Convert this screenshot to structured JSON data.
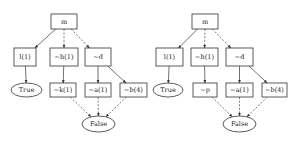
{
  "diagrams": [
    {
      "id": "left",
      "nodes": [
        {
          "key": "m",
          "label": "m",
          "shape": "box",
          "x": 51,
          "y": 14,
          "w": 26,
          "h": 15
        },
        {
          "key": "l1",
          "label": "l(1)",
          "shape": "box",
          "x": 14,
          "y": 48,
          "w": 22,
          "h": 18
        },
        {
          "key": "h1",
          "label": "~h(1)",
          "shape": "box",
          "x": 50,
          "y": 48,
          "w": 28,
          "h": 18
        },
        {
          "key": "d",
          "label": "~d",
          "shape": "box",
          "x": 85,
          "y": 48,
          "w": 26,
          "h": 18
        },
        {
          "key": "true",
          "label": "True",
          "shape": "ellipse",
          "x": 11,
          "y": 83,
          "w": 31,
          "h": 14
        },
        {
          "key": "k1",
          "label": "~k(1)",
          "shape": "box",
          "x": 50,
          "y": 83,
          "w": 26,
          "h": 14
        },
        {
          "key": "a1",
          "label": "~a(1)",
          "shape": "box",
          "x": 85,
          "y": 83,
          "w": 26,
          "h": 14
        },
        {
          "key": "b4",
          "label": "~b(4)",
          "shape": "box",
          "x": 120,
          "y": 83,
          "w": 27,
          "h": 14
        },
        {
          "key": "false",
          "label": "False",
          "shape": "ellipse",
          "x": 82,
          "y": 116,
          "w": 33,
          "h": 16
        }
      ],
      "edges": [
        {
          "from": "m",
          "to": "l1",
          "style": "solid"
        },
        {
          "from": "m",
          "to": "h1",
          "style": "dashed"
        },
        {
          "from": "m",
          "to": "d",
          "style": "dashed"
        },
        {
          "from": "l1",
          "to": "true",
          "style": "solid"
        },
        {
          "from": "h1",
          "to": "k1",
          "style": "solid"
        },
        {
          "from": "d",
          "to": "a1",
          "style": "solid"
        },
        {
          "from": "d",
          "to": "b4",
          "style": "solid"
        },
        {
          "from": "k1",
          "to": "false",
          "style": "dashed"
        },
        {
          "from": "a1",
          "to": "false",
          "style": "dashed"
        },
        {
          "from": "b4",
          "to": "false",
          "style": "dashed"
        }
      ]
    },
    {
      "id": "right",
      "nodes": [
        {
          "key": "m",
          "label": "m",
          "shape": "box",
          "x": 192,
          "y": 14,
          "w": 26,
          "h": 15
        },
        {
          "key": "l1",
          "label": "l(1)",
          "shape": "box",
          "x": 156,
          "y": 48,
          "w": 27,
          "h": 18
        },
        {
          "key": "h1",
          "label": "~h(1)",
          "shape": "box",
          "x": 191,
          "y": 48,
          "w": 27,
          "h": 18
        },
        {
          "key": "d",
          "label": "~d",
          "shape": "box",
          "x": 226,
          "y": 48,
          "w": 27,
          "h": 18
        },
        {
          "key": "true",
          "label": "True",
          "shape": "ellipse",
          "x": 153,
          "y": 83,
          "w": 30,
          "h": 14
        },
        {
          "key": "p",
          "label": "~p",
          "shape": "box",
          "x": 193,
          "y": 83,
          "w": 24,
          "h": 14
        },
        {
          "key": "a1",
          "label": "~a(1)",
          "shape": "box",
          "x": 226,
          "y": 83,
          "w": 27,
          "h": 14
        },
        {
          "key": "b4",
          "label": "~b(4)",
          "shape": "box",
          "x": 262,
          "y": 83,
          "w": 25,
          "h": 14
        },
        {
          "key": "false",
          "label": "False",
          "shape": "ellipse",
          "x": 223,
          "y": 116,
          "w": 33,
          "h": 16
        }
      ],
      "edges": [
        {
          "from": "m",
          "to": "l1",
          "style": "solid"
        },
        {
          "from": "m",
          "to": "h1",
          "style": "dashed"
        },
        {
          "from": "m",
          "to": "d",
          "style": "dashed"
        },
        {
          "from": "l1",
          "to": "true",
          "style": "solid"
        },
        {
          "from": "h1",
          "to": "p",
          "style": "solid"
        },
        {
          "from": "d",
          "to": "a1",
          "style": "solid"
        },
        {
          "from": "d",
          "to": "b4",
          "style": "solid"
        },
        {
          "from": "p",
          "to": "false",
          "style": "dashed"
        },
        {
          "from": "a1",
          "to": "false",
          "style": "dashed"
        },
        {
          "from": "b4",
          "to": "false",
          "style": "dashed"
        }
      ]
    }
  ]
}
